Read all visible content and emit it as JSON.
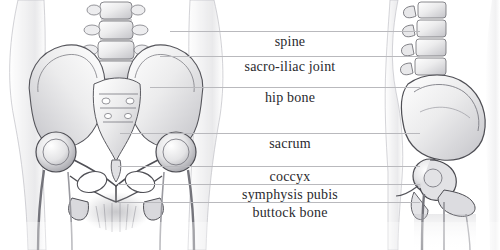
{
  "figure": {
    "view_left": "anterior view of pelvis and hip joints",
    "view_right": "lateral view of pelvis and hip joint",
    "background_color": "#ffffff",
    "text_color": "#2a2a2e",
    "leader_color": "#b9b9bd",
    "ink_dark": "#3a3a3e",
    "ink_mid": "#8d8d93",
    "ink_light": "#cfcfd4"
  },
  "labels": [
    {
      "id": "spine",
      "text": "spine",
      "x": 290,
      "y": 36,
      "leader": {
        "x": 170,
        "y": 31,
        "width": 250
      }
    },
    {
      "id": "sacro-iliac-joint",
      "text": "sacro-iliac joint",
      "x": 290,
      "y": 61,
      "leader": {
        "x": 160,
        "y": 56,
        "width": 260
      }
    },
    {
      "id": "hip-bone",
      "text": "hip bone",
      "x": 290,
      "y": 92,
      "leader": {
        "x": 150,
        "y": 87,
        "width": 270
      }
    },
    {
      "id": "sacrum",
      "text": "sacrum",
      "x": 290,
      "y": 138,
      "leader": {
        "x": 120,
        "y": 133,
        "width": 300
      }
    },
    {
      "id": "coccyx",
      "text": "coccyx",
      "x": 290,
      "y": 171,
      "leader": {
        "x": 118,
        "y": 166,
        "width": 302
      }
    },
    {
      "id": "symphysis-pubis",
      "text": "symphysis pubis",
      "x": 290,
      "y": 189,
      "leader": {
        "x": 118,
        "y": 184,
        "width": 302
      }
    },
    {
      "id": "buttock-bone",
      "text": "buttock bone",
      "x": 290,
      "y": 207,
      "leader": {
        "x": 118,
        "y": 202,
        "width": 302
      }
    }
  ]
}
